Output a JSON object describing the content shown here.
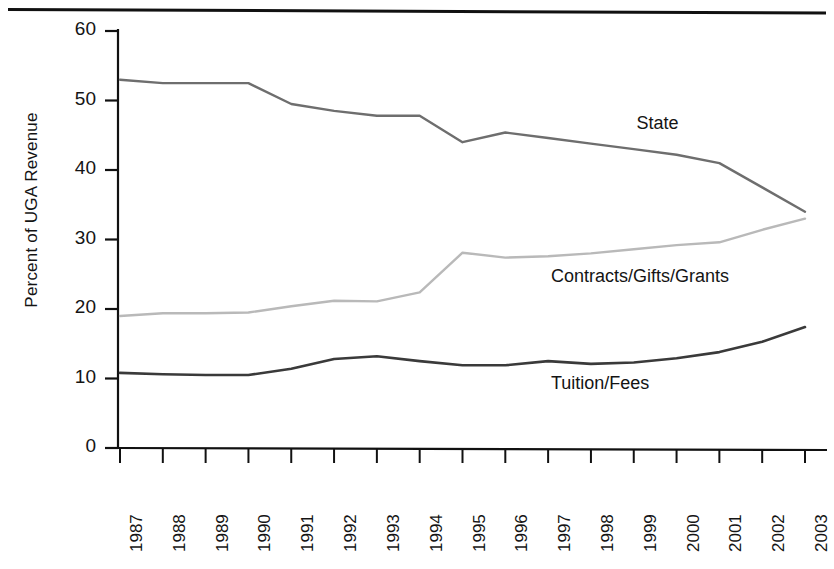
{
  "figure": {
    "background": "#ffffff",
    "has_top_rule": true
  },
  "chart_data": {
    "type": "line",
    "title": "",
    "xlabel": "",
    "ylabel": "Percent of UGA Revenue",
    "ylim": [
      0,
      60
    ],
    "yticks": [
      0,
      10,
      20,
      30,
      40,
      50,
      60
    ],
    "grid": false,
    "legend_position": "inline-annotations",
    "x": [
      1987,
      1988,
      1989,
      1990,
      1991,
      1992,
      1993,
      1994,
      1995,
      1996,
      1997,
      1998,
      1999,
      2000,
      2001,
      2002,
      2003
    ],
    "categories": [
      "1987",
      "1988",
      "1989",
      "1990",
      "1991",
      "1992",
      "1993",
      "1994",
      "1995",
      "1996",
      "1997",
      "1998",
      "1999",
      "2000",
      "2001",
      "2002",
      "2003"
    ],
    "series": [
      {
        "name": "State",
        "color": "#6e6e6e",
        "width": 2.4,
        "label_x": 2000,
        "label_y": 46.5,
        "values": [
          53.0,
          52.5,
          52.5,
          52.5,
          49.5,
          48.5,
          47.8,
          47.8,
          44.0,
          45.4,
          44.6,
          43.8,
          43.0,
          42.2,
          41.0,
          37.5,
          34.0
        ]
      },
      {
        "name": "Contracts/Gifts/Grants",
        "color": "#b9b9b9",
        "width": 2.4,
        "label_x": 1998,
        "label_y": 24.5,
        "values": [
          19.0,
          19.4,
          19.4,
          19.5,
          20.4,
          21.2,
          21.1,
          22.4,
          28.1,
          27.4,
          27.6,
          28.0,
          28.6,
          29.2,
          29.6,
          31.4,
          33.0
        ]
      },
      {
        "name": "Tuition/Fees",
        "color": "#3a3a3a",
        "width": 2.6,
        "label_x": 1998,
        "label_y": 9.0,
        "values": [
          10.8,
          10.6,
          10.5,
          10.5,
          11.4,
          12.8,
          13.2,
          12.5,
          11.9,
          11.9,
          12.5,
          12.1,
          12.3,
          12.9,
          13.8,
          15.3,
          17.4
        ]
      }
    ]
  }
}
